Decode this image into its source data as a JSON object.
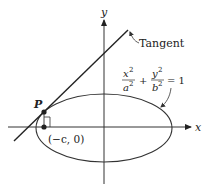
{
  "diagram": {
    "axes": {
      "x_label": "x",
      "y_label": "y"
    },
    "tangent_label": "Tangent",
    "point_label": "P",
    "focus_label": "(−c, 0)",
    "equation": {
      "term1_num": "x",
      "term1_num_exp": "2",
      "term1_den": "a",
      "term1_den_exp": "2",
      "plus": "+",
      "term2_num": "y",
      "term2_num_exp": "2",
      "term2_den": "b",
      "term2_den_exp": "2",
      "equals": "= 1"
    },
    "colors": {
      "stroke": "#333333",
      "background": "#ffffff"
    }
  }
}
